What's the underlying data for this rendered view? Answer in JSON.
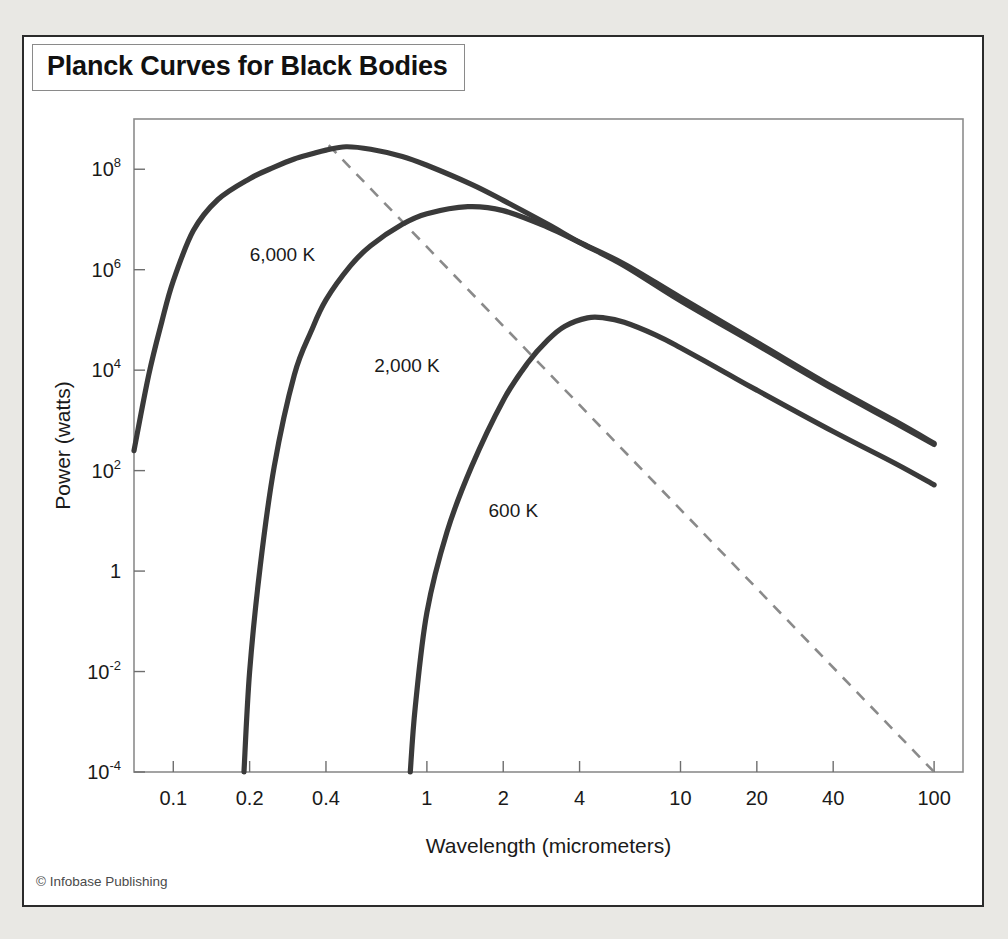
{
  "figure": {
    "title": "Planck Curves for Black Bodies",
    "credit": "© Infobase Publishing"
  },
  "chart_data": {
    "type": "line",
    "title": "Planck Curves for Black Bodies",
    "xlabel": "Wavelength (micrometers)",
    "ylabel": "Power (watts)",
    "xscale": "log",
    "yscale": "log",
    "xlim": [
      0.07,
      130
    ],
    "ylim": [
      0.0001,
      1000000000
    ],
    "grid": false,
    "legend": "inline-labels",
    "xticks": [
      {
        "value": 0.1,
        "label": "0.1"
      },
      {
        "value": 0.2,
        "label": "0.2"
      },
      {
        "value": 0.4,
        "label": "0.4"
      },
      {
        "value": 1,
        "label": "1"
      },
      {
        "value": 2,
        "label": "2"
      },
      {
        "value": 4,
        "label": "4"
      },
      {
        "value": 10,
        "label": "10"
      },
      {
        "value": 20,
        "label": "20"
      },
      {
        "value": 40,
        "label": "40"
      },
      {
        "value": 100,
        "label": "100"
      }
    ],
    "yticks": [
      {
        "value": 100000000,
        "mantissa": "10",
        "exponent": "8"
      },
      {
        "value": 1000000,
        "mantissa": "10",
        "exponent": "6"
      },
      {
        "value": 10000,
        "mantissa": "10",
        "exponent": "4"
      },
      {
        "value": 100,
        "mantissa": "10",
        "exponent": "2"
      },
      {
        "value": 1,
        "mantissa": "1",
        "exponent": ""
      },
      {
        "value": 0.01,
        "mantissa": "10",
        "exponent": "-2"
      },
      {
        "value": 0.0001,
        "mantissa": "10",
        "exponent": "-4"
      }
    ],
    "series": [
      {
        "name": "6,000 K",
        "temperature_k": 6000,
        "color": "#3a3a3a",
        "peak": {
          "wavelength_um": 0.48,
          "power_w": 30000000
        },
        "label_pos": {
          "wavelength_um": 0.2,
          "power_w": 1500000
        },
        "points": [
          [
            0.07,
            250
          ],
          [
            0.08,
            8000
          ],
          [
            0.09,
            90000
          ],
          [
            0.1,
            600000
          ],
          [
            0.12,
            6000000
          ],
          [
            0.15,
            25000000.0
          ],
          [
            0.2,
            65000000.0
          ],
          [
            0.25,
            110000000.0
          ],
          [
            0.3,
            160000000.0
          ],
          [
            0.35,
            200000000.0
          ],
          [
            0.4,
            240000000.0
          ],
          [
            0.48,
            280000000.0
          ],
          [
            0.6,
            250000000.0
          ],
          [
            0.8,
            180000000.0
          ],
          [
            1,
            120000000.0
          ],
          [
            1.5,
            50000000.0
          ],
          [
            2,
            24000000.0
          ],
          [
            3,
            8000000.0
          ],
          [
            4,
            3500000.0
          ],
          [
            6,
            1200000.0
          ],
          [
            10,
            240000.0
          ],
          [
            20,
            32000.0
          ],
          [
            40,
            4200.0
          ],
          [
            70,
            900
          ],
          [
            100,
            330
          ]
        ]
      },
      {
        "name": "2,000 K",
        "temperature_k": 2000,
        "color": "#3a3a3a",
        "peak": {
          "wavelength_um": 1.45,
          "power_w": 180000
        },
        "label_pos": {
          "wavelength_um": 0.62,
          "power_w": 9000
        },
        "points": [
          [
            0.19,
            0.0001
          ],
          [
            0.2,
            0.01
          ],
          [
            0.22,
            1.2
          ],
          [
            0.25,
            120
          ],
          [
            0.3,
            8000
          ],
          [
            0.35,
            60000
          ],
          [
            0.4,
            250000.0
          ],
          [
            0.5,
            1200000.0
          ],
          [
            0.6,
            3000000.0
          ],
          [
            0.8,
            8000000.0
          ],
          [
            1,
            13000000.0
          ],
          [
            1.45,
            18000000.0
          ],
          [
            2,
            15000000.0
          ],
          [
            3,
            7000000.0
          ],
          [
            4,
            3500000.0
          ],
          [
            6,
            1300000.0
          ],
          [
            10,
            280000.0
          ],
          [
            20,
            36000.0
          ],
          [
            40,
            4600.0
          ],
          [
            70,
            980
          ],
          [
            100,
            350
          ]
        ]
      },
      {
        "name": "600 K",
        "temperature_k": 600,
        "color": "#3a3a3a",
        "peak": {
          "wavelength_um": 4.3,
          "power_w": 370
        },
        "label_pos": {
          "wavelength_um": 1.75,
          "power_w": 12
        },
        "points": [
          [
            0.86,
            0.0001
          ],
          [
            0.9,
            0.002
          ],
          [
            1,
            0.15
          ],
          [
            1.2,
            6
          ],
          [
            1.5,
            120
          ],
          [
            2,
            2500
          ],
          [
            2.5,
            14000.0
          ],
          [
            3,
            40000.0
          ],
          [
            3.5,
            75000.0
          ],
          [
            4.3,
            110000.0
          ],
          [
            5,
            110000.0
          ],
          [
            6,
            90000.0
          ],
          [
            8,
            50000.0
          ],
          [
            10,
            28000.0
          ],
          [
            15,
            9000.0
          ],
          [
            20,
            4000.0
          ],
          [
            40,
            600.0
          ],
          [
            70,
            140
          ],
          [
            100,
            52
          ]
        ]
      }
    ],
    "annotations": [
      {
        "name": "wien-displacement-line",
        "style": "dashed",
        "color": "#8a8a8a",
        "start": {
          "wavelength_um": 0.41,
          "power_w": 300000000.0
        },
        "end": {
          "wavelength_um": 100,
          "power_w": 0.0001
        }
      }
    ]
  }
}
